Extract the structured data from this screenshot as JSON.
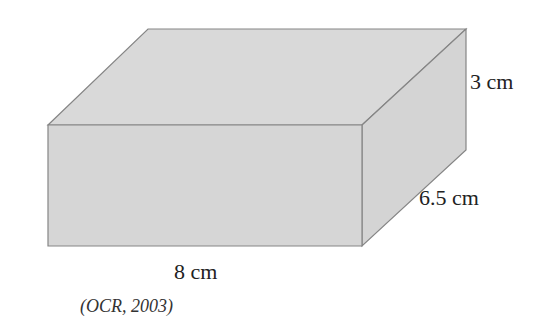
{
  "diagram": {
    "shape": "cuboid",
    "fill_color": "#d6d6d6",
    "edge_color": "#808080",
    "dimensions": {
      "length": "8 cm",
      "width": "6.5 cm",
      "height": "3 cm"
    }
  },
  "caption": "(OCR, 2003)"
}
